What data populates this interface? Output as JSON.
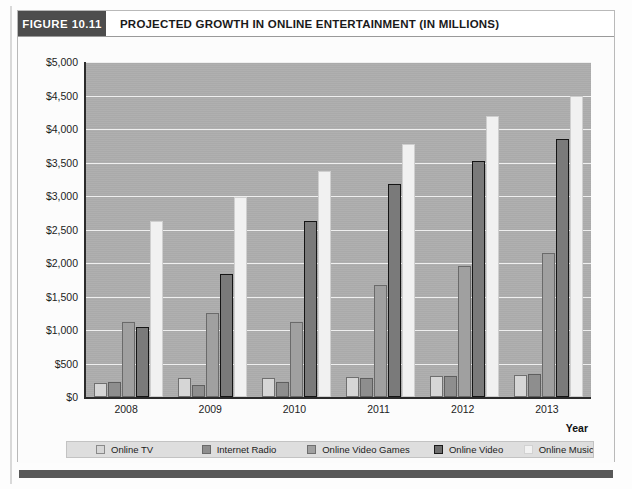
{
  "figure": {
    "number_label": "FIGURE 10.11",
    "title": "PROJECTED GROWTH IN ONLINE ENTERTAINMENT (IN MILLIONS)"
  },
  "axis": {
    "x_title": "Year",
    "y_ticks": [
      "$5,000",
      "$4,500",
      "$4,000",
      "$3,500",
      "$3,000",
      "$2,500",
      "$2,000",
      "$1,500",
      "$1,000",
      "$500",
      "$0"
    ],
    "x_ticks": [
      "2008",
      "2009",
      "2010",
      "2011",
      "2012",
      "2013"
    ]
  },
  "legend": {
    "items": [
      {
        "label": "Online TV",
        "color": "#d6d6d6"
      },
      {
        "label": "Internet Radio",
        "color": "#8e8e8e"
      },
      {
        "label": "Online Video Games",
        "color": "#a0a0a0"
      },
      {
        "label": "Online Video",
        "color": "#6e6e6e"
      },
      {
        "label": "Online Music",
        "color": "#f2f2f2"
      }
    ]
  },
  "chart_data": {
    "type": "bar",
    "title": "PROJECTED GROWTH IN ONLINE ENTERTAINMENT (IN MILLIONS)",
    "xlabel": "Year",
    "ylabel": "",
    "ylim": [
      0,
      5000
    ],
    "ytick_step": 500,
    "grid": true,
    "legend_position": "bottom",
    "categories": [
      "2008",
      "2009",
      "2010",
      "2011",
      "2012",
      "2013"
    ],
    "series": [
      {
        "name": "Online TV",
        "color": "#d6d6d6",
        "values": [
          210,
          290,
          290,
          300,
          310,
          330
        ]
      },
      {
        "name": "Internet Radio",
        "color": "#8e8e8e",
        "values": [
          225,
          180,
          220,
          290,
          320,
          350
        ]
      },
      {
        "name": "Online Video Games",
        "color": "#a0a0a0",
        "values": [
          1120,
          1250,
          1120,
          1670,
          1950,
          2150
        ]
      },
      {
        "name": "Online Video",
        "color": "#6e6e6e",
        "values": [
          1050,
          1830,
          2620,
          3180,
          3530,
          3850
        ]
      },
      {
        "name": "Online Music",
        "color": "#f2f2f2",
        "values": [
          2630,
          2990,
          3380,
          3780,
          4200,
          4500
        ]
      }
    ]
  }
}
